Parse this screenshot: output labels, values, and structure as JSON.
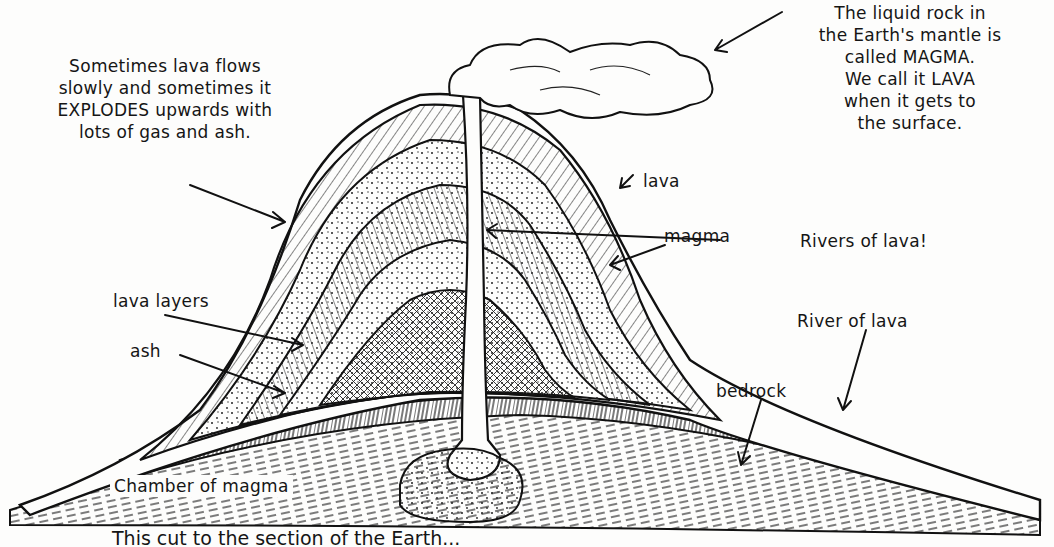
{
  "diagram": {
    "type": "cross-section",
    "annotations": {
      "explosion_note": [
        "Sometimes lava flows",
        "slowly and sometimes it",
        "EXPLODES upwards with",
        "lots of gas and ash."
      ],
      "magma_note": [
        "The liquid rock in",
        "the Earth's mantle is",
        "called MAGMA.",
        "We call it LAVA",
        "when it gets to",
        "the surface."
      ],
      "lava": "lava",
      "magma": "magma",
      "rivers_of_lava": "Rivers of lava!",
      "river_of_lava": "River of lava",
      "lava_layers": "lava layers",
      "ash": "ash",
      "bedrock": "bedrock",
      "chamber": "Chamber of magma"
    },
    "caption": "This cut to the section of the Earth..."
  },
  "colors": {
    "ink": "#151515",
    "paper": "#fdfdfc"
  }
}
